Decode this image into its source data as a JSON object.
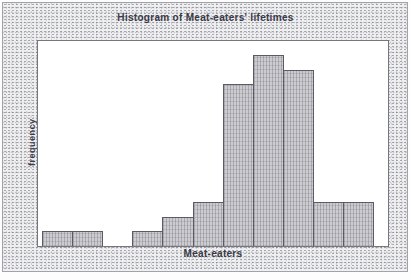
{
  "figure": {
    "title": "Histogram of Meat-eaters' lifetimes",
    "x_axis_label": "Meat-eaters",
    "y_axis_label": "frequency"
  },
  "colors": {
    "text": "#3a3a48",
    "panel": "#ffffff",
    "bar_fill": "#ccccd0",
    "bar_border": "#5b5b64",
    "frame_fill": "#efeff1"
  },
  "chart_data": {
    "type": "bar",
    "subtype": "histogram",
    "title": "Histogram of Meat-eaters' lifetimes",
    "xlabel": "Meat-eaters",
    "ylabel": "frequency",
    "categories": [
      "bin1",
      "bin2",
      "bin3",
      "bin4",
      "bin5",
      "bin6",
      "bin7",
      "bin8",
      "bin9",
      "bin10",
      "bin11"
    ],
    "values": [
      1,
      1,
      0,
      1,
      2,
      3,
      11,
      13,
      12,
      3,
      3
    ],
    "ylim": [
      0,
      13
    ],
    "x_tick_labels_shown": false,
    "y_tick_labels_shown": false,
    "grid": false,
    "legend": false,
    "bar_gap": 0
  }
}
